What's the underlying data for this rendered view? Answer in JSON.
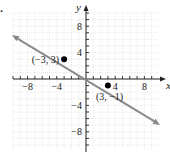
{
  "problem": {
    "label": "."
  },
  "chart_data": {
    "type": "line",
    "title": "",
    "xlabel": "x",
    "ylabel": "y",
    "xlim": [
      -10,
      10
    ],
    "ylim": [
      -10,
      10
    ],
    "grid": true,
    "x_tick_labels": [
      "-8",
      "-4",
      "4",
      "8"
    ],
    "y_tick_labels": [
      "8",
      "4",
      "-4",
      "-8"
    ],
    "x_tick_values": [
      -8,
      -4,
      4,
      8
    ],
    "y_tick_values": [
      8,
      4,
      -4,
      -8
    ],
    "series": [
      {
        "name": "line",
        "style": "line-with-arrows",
        "color": "#8a8a8a",
        "x": [
          -10,
          10
        ],
        "y": [
          6.5,
          -6.8
        ]
      }
    ],
    "points": [
      {
        "x": -3,
        "y": 3,
        "label": "(−3, 3)"
      },
      {
        "x": 3,
        "y": -1,
        "label": "(3, −1)"
      }
    ],
    "colors": {
      "grid": "#d4d4d4",
      "axis": "#222222",
      "line": "#8a8a8a",
      "point": "#000000"
    }
  }
}
